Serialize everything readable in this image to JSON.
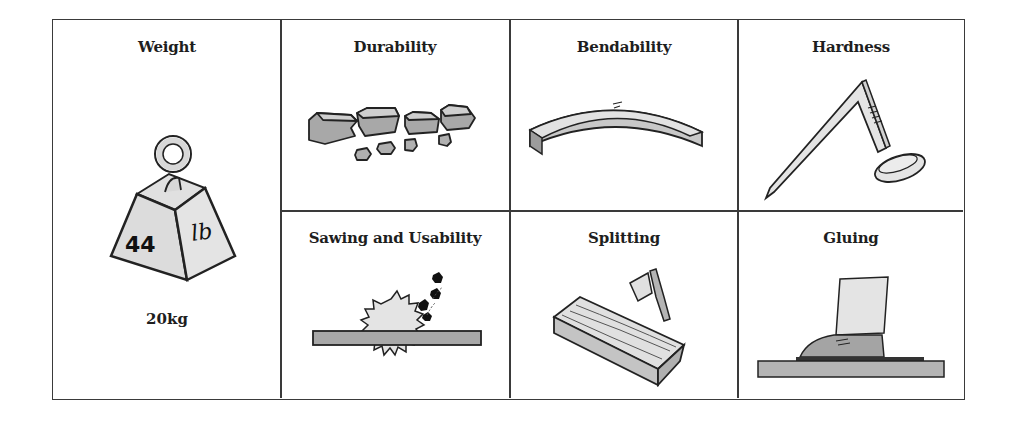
{
  "properties": {
    "weight": {
      "title": "Weight",
      "weight_number": "44",
      "weight_unit": "lb",
      "caption": "20kg",
      "icon": "weight-icon"
    },
    "durability": {
      "title": "Durability",
      "icon": "broken-wood-pieces-icon"
    },
    "bendability": {
      "title": "Bendability",
      "icon": "bent-beam-icon"
    },
    "hardness": {
      "title": "Hardness",
      "icon": "bent-nail-icon"
    },
    "sawing": {
      "title": "Sawing and Usability",
      "icon": "circular-saw-icon"
    },
    "splitting": {
      "title": "Splitting",
      "icon": "axe-and-log-icon"
    },
    "gluing": {
      "title": "Gluing",
      "icon": "foot-pressing-board-icon"
    }
  },
  "colors": {
    "border": "#3a3a3a",
    "fill_light": "#e2e2e2",
    "fill_mid": "#b8b8b8",
    "fill_dark": "#8a8a8a",
    "stroke": "#222222"
  }
}
